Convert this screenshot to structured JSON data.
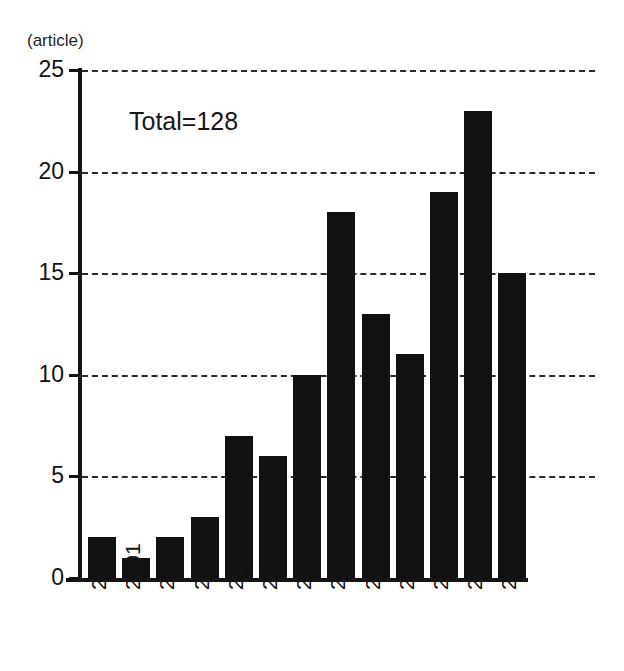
{
  "chart_data": {
    "type": "bar",
    "title": "",
    "subtitle": "",
    "unit_note": "(article)",
    "annotation": "Total=128",
    "xlabel": "",
    "ylabel": "",
    "categories": [
      "2000",
      "2001",
      "2002",
      "2003",
      "2004",
      "2005",
      "2006",
      "2007",
      "2008",
      "2009",
      "2010",
      "2011",
      "2012"
    ],
    "values": [
      2,
      1,
      2,
      3,
      7,
      6,
      10,
      18,
      13,
      11,
      19,
      23,
      15
    ],
    "ylim": [
      0,
      25
    ],
    "yticks": [
      0,
      5,
      10,
      15,
      20,
      25
    ],
    "ytick_labels": [
      "0",
      "5",
      "10",
      "15",
      "20",
      "25"
    ],
    "grid": true,
    "grid_style": "dashed-horizontal",
    "legend": "none",
    "bar_color": "#111111",
    "grid_color": "#2b2b2b",
    "axis_color": "#141414",
    "background_color": "#ffffff",
    "xtick_rotation": -90,
    "total": 128
  }
}
